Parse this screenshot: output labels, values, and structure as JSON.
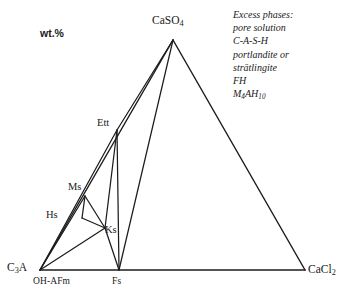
{
  "figure": {
    "type": "ternary-phase-diagram",
    "units_label": "wt.%"
  },
  "vertices": [
    {
      "id": "c3a",
      "label": "C",
      "sub": "3",
      "tail": "A",
      "x": 40,
      "y": 270
    },
    {
      "id": "caso4",
      "label": "CaSO",
      "sub": "4",
      "tail": "",
      "x": 173,
      "y": 40
    },
    {
      "id": "cacl2",
      "label": "CaCl",
      "sub": "2",
      "tail": "",
      "x": 305,
      "y": 270
    }
  ],
  "vertex_labels": {
    "c3a": "C3A",
    "caso4": "CaSO4",
    "cacl2": "CaCl2"
  },
  "axis_sub_labels": [
    {
      "id": "oh-afm",
      "text": "OH-AFm",
      "x": 33,
      "y": 277
    },
    {
      "id": "fs",
      "text": "Fs",
      "x": 112,
      "y": 277
    }
  ],
  "interior_nodes": [
    {
      "id": "ett",
      "label": "Ett",
      "x": 117,
      "y": 130,
      "label_x": 97,
      "label_y": 117
    },
    {
      "id": "ms",
      "label": "Ms",
      "x": 85,
      "y": 196,
      "label_x": 68,
      "label_y": 181
    },
    {
      "id": "hs",
      "label": "Hs",
      "x": 82,
      "y": 218,
      "label_x": 46,
      "label_y": 209
    },
    {
      "id": "ks",
      "label": "Ks",
      "x": 105,
      "y": 228,
      "label_x": 105,
      "label_y": 224
    },
    {
      "id": "fs",
      "label": "",
      "x": 119,
      "y": 270,
      "label_x": 0,
      "label_y": 0
    }
  ],
  "node_labels": {
    "ett": "Ett",
    "ms": "Ms",
    "hs": "Hs",
    "ks": "Ks"
  },
  "edges": [
    {
      "from": "c3a",
      "to": "caso4"
    },
    {
      "from": "caso4",
      "to": "cacl2"
    },
    {
      "from": "c3a",
      "to": "cacl2"
    }
  ],
  "tie_lines": [
    {
      "from": "caso4",
      "to": "ett"
    },
    {
      "from": "caso4",
      "to": "fs"
    },
    {
      "from": "ett",
      "to": "c3a"
    },
    {
      "from": "ett",
      "to": "fs"
    },
    {
      "from": "ett",
      "to": "ks"
    },
    {
      "from": "ms",
      "to": "hs"
    },
    {
      "from": "ms",
      "to": "ks"
    },
    {
      "from": "hs",
      "to": "ks"
    },
    {
      "from": "ks",
      "to": "c3a"
    },
    {
      "from": "ks",
      "to": "fs"
    },
    {
      "from": "c3a",
      "to": "ms"
    }
  ],
  "legend": {
    "lines": [
      {
        "id": "heading",
        "text": "Excess phases:"
      },
      {
        "id": "pore",
        "text": "pore solution"
      },
      {
        "id": "cash",
        "text": "C-A-S-H"
      },
      {
        "id": "portlandite",
        "text": "portlandite or"
      },
      {
        "id": "stratlingite",
        "text": "strätlingite"
      },
      {
        "id": "fh",
        "text": "FH"
      },
      {
        "id": "m4ah10",
        "text": "M4AH10",
        "base": "M",
        "sub1": "4",
        "mid": "AH",
        "sub2": "10"
      }
    ]
  },
  "colors": {
    "line": "#1c1c1c",
    "text": "#1a1a1a",
    "background": "#ffffff"
  },
  "chart_data": {
    "type": "scatter",
    "title": "",
    "xlabel": "",
    "ylabel": "",
    "diagram_kind": "ternary phase diagram",
    "components": [
      "C3A",
      "CaSO4",
      "CaCl2"
    ],
    "units": "wt.%",
    "corner_points": [
      {
        "name": "C3A",
        "pixel": [
          40,
          270
        ]
      },
      {
        "name": "CaSO4",
        "pixel": [
          173,
          40
        ]
      },
      {
        "name": "CaCl2",
        "pixel": [
          305,
          270
        ]
      }
    ],
    "phase_points": [
      {
        "name": "Ett",
        "pixel": [
          117,
          130
        ]
      },
      {
        "name": "Ms",
        "pixel": [
          85,
          196
        ]
      },
      {
        "name": "Hs",
        "pixel": [
          82,
          218
        ]
      },
      {
        "name": "Ks",
        "pixel": [
          105,
          228
        ]
      },
      {
        "name": "Fs",
        "pixel": [
          119,
          270
        ]
      },
      {
        "name": "OH-AFm",
        "pixel": [
          40,
          270
        ]
      }
    ],
    "tie_line_pairs": [
      [
        "CaSO4",
        "Ett"
      ],
      [
        "CaSO4",
        "Fs"
      ],
      [
        "Ett",
        "C3A"
      ],
      [
        "Ett",
        "Fs"
      ],
      [
        "Ett",
        "Ks"
      ],
      [
        "Ms",
        "Hs"
      ],
      [
        "Ms",
        "Ks"
      ],
      [
        "Hs",
        "Ks"
      ],
      [
        "Ks",
        "C3A"
      ],
      [
        "Ks",
        "Fs"
      ],
      [
        "C3A",
        "Ms"
      ]
    ],
    "legend": [
      "Excess phases:",
      "pore solution",
      "C-A-S-H",
      "portlandite or",
      "strätlingite",
      "FH",
      "M4AH10"
    ],
    "grid": false,
    "legend_position": "top-right"
  }
}
